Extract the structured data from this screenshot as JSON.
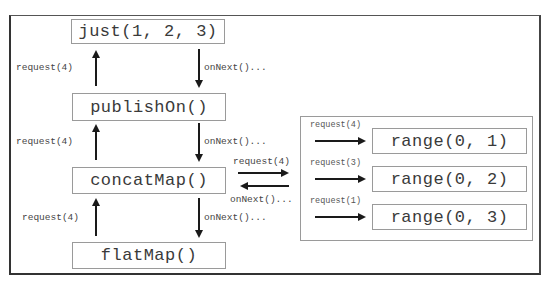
{
  "diagram": {
    "operators": [
      {
        "id": "just",
        "label": "just(1, 2, 3)"
      },
      {
        "id": "publishOn",
        "label": "publishOn()"
      },
      {
        "id": "concatMap",
        "label": "concatMap()"
      },
      {
        "id": "flatMap",
        "label": "flatMap()"
      }
    ],
    "chain_labels": {
      "request_just": "request(4)",
      "onnext_just": "onNext()...",
      "request_publishon": "request(4)",
      "onnext_publishon": "onNext()...",
      "request_concatmap": "request(4)",
      "onnext_concatmap": "onNext()..."
    },
    "inner": {
      "request_label": "request(4)",
      "onnext_label": "onNext()...",
      "sources": [
        {
          "label": "range(0, 1)",
          "request": "request(4)"
        },
        {
          "label": "range(0, 2)",
          "request": "request(3)"
        },
        {
          "label": "range(0, 3)",
          "request": "request(1)"
        }
      ]
    },
    "colors": {
      "arrow": "#1a1a1a",
      "box_border": "#9a9a9a",
      "frame_border": "#333333",
      "text": "#3a3a3a"
    }
  }
}
